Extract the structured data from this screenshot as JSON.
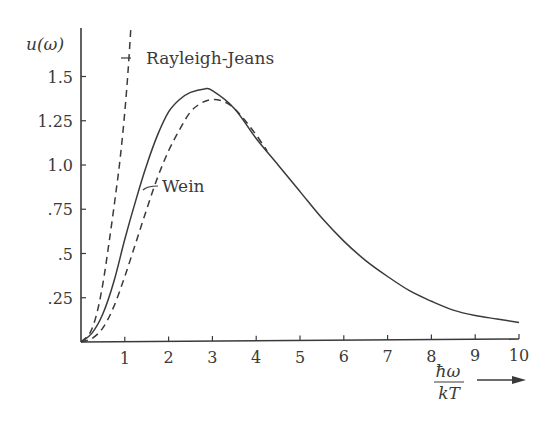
{
  "chart_data": {
    "type": "line",
    "title": "",
    "xlabel": "ħω / kT",
    "ylabel": "u(ω)",
    "xlim": [
      0,
      10
    ],
    "ylim": [
      0,
      1.75
    ],
    "grid": false,
    "legend": "inline annotations",
    "x_ticks": [
      1,
      2,
      3,
      4,
      5,
      6,
      7,
      8,
      9,
      10
    ],
    "x_tick_labels": [
      "1",
      "2",
      "3",
      "4",
      "5",
      "6",
      "7",
      "8",
      "9",
      "10"
    ],
    "y_ticks": [
      0.25,
      0.5,
      0.75,
      1.0,
      1.25,
      1.5
    ],
    "y_tick_labels": [
      ".25",
      ".5",
      ".75",
      "1.0",
      "1.25",
      "1.5"
    ],
    "series": [
      {
        "name": "Planck",
        "style": "solid",
        "x": [
          0,
          0.25,
          0.5,
          0.75,
          1,
          1.25,
          1.5,
          1.75,
          2,
          2.25,
          2.5,
          2.82,
          3,
          3.5,
          4,
          4.5,
          5,
          5.5,
          6,
          6.5,
          7,
          7.5,
          8,
          8.5,
          9,
          9.5,
          10
        ],
        "values": [
          0,
          0.05,
          0.16,
          0.34,
          0.58,
          0.8,
          1.0,
          1.17,
          1.3,
          1.37,
          1.41,
          1.43,
          1.42,
          1.32,
          1.15,
          1.0,
          0.85,
          0.7,
          0.57,
          0.46,
          0.37,
          0.29,
          0.23,
          0.18,
          0.15,
          0.13,
          0.11
        ]
      },
      {
        "name": "Wein",
        "style": "dashed",
        "x": [
          0,
          0.25,
          0.5,
          0.75,
          1,
          1.25,
          1.5,
          1.75,
          2,
          2.25,
          2.5,
          2.75,
          3,
          3.25,
          3.5,
          3.75,
          4,
          4.25
        ],
        "values": [
          0,
          0.02,
          0.08,
          0.2,
          0.37,
          0.56,
          0.75,
          0.93,
          1.08,
          1.2,
          1.3,
          1.35,
          1.37,
          1.36,
          1.32,
          1.25,
          1.17,
          1.08
        ]
      },
      {
        "name": "Rayleigh-Jeans",
        "style": "dashed",
        "x": [
          0,
          0.2,
          0.35,
          0.5,
          0.65,
          0.8,
          0.9,
          1.0,
          1.08,
          1.14
        ],
        "values": [
          0,
          0.05,
          0.15,
          0.33,
          0.58,
          0.85,
          1.05,
          1.3,
          1.55,
          1.78
        ]
      }
    ],
    "annotations": [
      {
        "text": "Rayleigh-Jeans",
        "target_series": "Rayleigh-Jeans"
      },
      {
        "text": "Wein",
        "target_series": "Wein"
      }
    ]
  },
  "labels": {
    "y_axis": "u(ω)",
    "x_axis_numerator": "ħω",
    "x_axis_denominator": "kT",
    "rayleigh_jeans": "Rayleigh-Jeans",
    "wein": "Wein"
  },
  "colors": {
    "ink": "#3a3a3a",
    "background": "#ffffff"
  }
}
